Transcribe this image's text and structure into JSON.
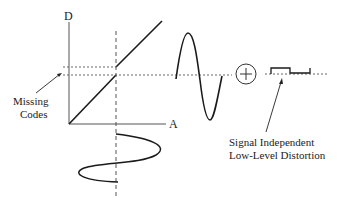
{
  "diagram": {
    "axes": {
      "y_label": "D",
      "x_label": "A"
    },
    "annotations": {
      "missing_codes_line1": "Missing",
      "missing_codes_line2": "Codes",
      "distortion_line1": "Signal Independent",
      "distortion_line2": "Low-Level Distortion"
    },
    "operator_symbol": "+",
    "colors": {
      "stroke": "#1a1a1a",
      "dashed": "#444444",
      "background": "#ffffff"
    }
  }
}
